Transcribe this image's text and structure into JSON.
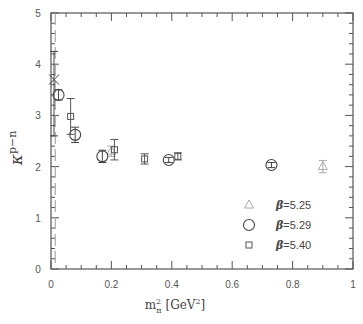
{
  "chart_data": {
    "type": "scatter",
    "title": "",
    "xlabel": "m_π² [GeV²]",
    "xlabel_parts": {
      "main": "m",
      "sup": "2",
      "sub": "π",
      "unit": "[GeV",
      "unit_sup": "2",
      "unit_close": "]"
    },
    "ylabel": "κ^{p−n}",
    "ylabel_parts": {
      "kappa": "κ",
      "sup": "p−n"
    },
    "xlim": [
      0,
      1
    ],
    "ylim": [
      0,
      5
    ],
    "xticks": [
      "0",
      "0.2",
      "0.4",
      "0.6",
      "0.8",
      "1"
    ],
    "yticks": [
      "0",
      "1",
      "2",
      "3",
      "4",
      "5"
    ],
    "grid": false,
    "legend_position": "lower right",
    "vertical_dashed_line_x": 0.014,
    "series": [
      {
        "name": "β=5.25",
        "beta": "5.25",
        "marker": "triangle",
        "color": "#aaaaaa",
        "points": [
          {
            "x": 0.2,
            "y": 2.3,
            "err": 0.1
          },
          {
            "x": 0.9,
            "y": 2.0,
            "err": 0.12
          }
        ]
      },
      {
        "name": "β=5.29",
        "beta": "5.29",
        "marker": "circle",
        "color": "#444444",
        "points": [
          {
            "x": 0.025,
            "y": 3.4,
            "err": 0.1
          },
          {
            "x": 0.08,
            "y": 2.62,
            "err": 0.15
          },
          {
            "x": 0.17,
            "y": 2.2,
            "err": 0.12
          },
          {
            "x": 0.39,
            "y": 2.13,
            "err": 0.05
          },
          {
            "x": 0.73,
            "y": 2.03,
            "err": 0.05
          }
        ]
      },
      {
        "name": "β=5.40",
        "beta": "5.40",
        "marker": "square",
        "color": "#555555",
        "points": [
          {
            "x": 0.065,
            "y": 2.98,
            "err": 0.35
          },
          {
            "x": 0.21,
            "y": 2.33,
            "err": 0.2
          },
          {
            "x": 0.31,
            "y": 2.15,
            "err": 0.1
          },
          {
            "x": 0.42,
            "y": 2.2,
            "err": 0.07
          }
        ]
      },
      {
        "name": "chiral extrapolation",
        "marker": "cross",
        "color": "#444444",
        "points": [
          {
            "x": 0.01,
            "y": 3.7,
            "err_up": 0.55,
            "err_down": 1.1
          }
        ]
      }
    ]
  }
}
